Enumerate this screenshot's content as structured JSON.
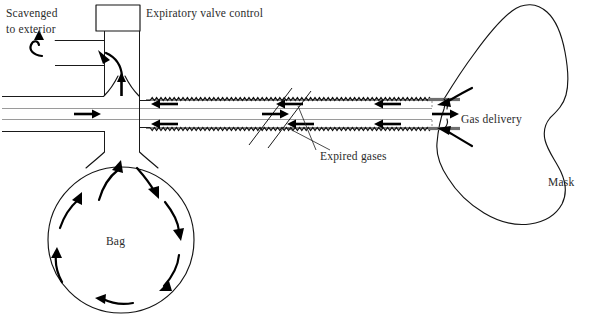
{
  "figure": {
    "width": 594,
    "height": 335,
    "background_color": "#ffffff",
    "line_color": "#141414",
    "text_color": "#2b2b2b"
  },
  "labels": {
    "scavenged_line1": "Scavenged",
    "scavenged_line2": "to exterior",
    "expiratory_valve_control": "Expiratory valve control",
    "expired_gases": "Expired gases",
    "gas_delivery": "Gas delivery",
    "bag": "Bag",
    "mask": "Mask"
  },
  "components": [
    {
      "name": "expiratory-valve-box",
      "label": "Expiratory valve control",
      "shape": "rectangle"
    },
    {
      "name": "scavenging-pipe",
      "label": "Scavenged to exterior",
      "shape": "stepped-pipe"
    },
    {
      "name": "coaxial-tube",
      "label": "",
      "shape": "corrugated-outer-with-inner-tube"
    },
    {
      "name": "reservoir-bag",
      "label": "Bag",
      "shape": "circle"
    },
    {
      "name": "face-mask",
      "label": "Mask",
      "shape": "kidney-outline"
    },
    {
      "name": "tube-break-mark",
      "label": "",
      "shape": "double-diagonal-slash"
    }
  ],
  "flow_arrows": [
    {
      "name": "fresh-gas-flow-left",
      "direction": "right",
      "meaning": "fresh gas travelling toward patient"
    },
    {
      "name": "fresh-gas-flow-mid",
      "direction": "right",
      "meaning": "fresh gas travelling toward patient"
    },
    {
      "name": "gas-delivery-arrow",
      "direction": "right",
      "meaning": "gas delivery to mask"
    },
    {
      "name": "expired-gas-upper-return",
      "direction": "left",
      "meaning": "expired gas returning in outer tube"
    },
    {
      "name": "expired-gas-lower-return",
      "direction": "left",
      "meaning": "expired gas returning in outer tube"
    },
    {
      "name": "expired-gas-mask-upper",
      "direction": "left",
      "meaning": "expired gas leaving mask"
    },
    {
      "name": "expired-gas-mask-lower",
      "direction": "left",
      "meaning": "expired gas leaving mask"
    },
    {
      "name": "bag-inflow-arrow",
      "direction": "up",
      "meaning": "gas entering reservoir bag neck"
    },
    {
      "name": "valve-vertical-arrow",
      "direction": "up",
      "meaning": "gas rising to expiratory valve"
    },
    {
      "name": "valve-curved-arrow",
      "direction": "up-left",
      "meaning": "gas diverted into scavenging limb"
    },
    {
      "name": "scavenge-exit-arrow",
      "direction": "up-left",
      "meaning": "scavenged to exterior"
    },
    {
      "name": "bag-circulation-arrows",
      "direction": "clockwise",
      "meaning": "gas circulating within reservoir bag",
      "count": 8
    }
  ]
}
